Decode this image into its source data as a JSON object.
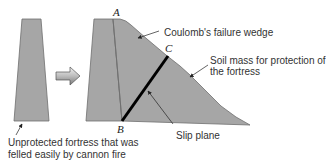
{
  "colors": {
    "fill": "#a6a6a6",
    "stroke": "#6f6f6f",
    "slip_plane": "#000000",
    "text": "#333333"
  },
  "points": {
    "a": "A",
    "b": "B",
    "c": "C"
  },
  "labels": {
    "wedge": "Coulomb's failure wedge",
    "soil_line1": "Soil mass for protection of",
    "soil_line2": "the fortress",
    "slip_plane": "Slip plane",
    "unprotected_line1": "Unprotected fortress that was",
    "unprotected_line2": "felled easily by cannon fire"
  },
  "icons": {
    "transition_arrow": "right-arrow-icon"
  }
}
